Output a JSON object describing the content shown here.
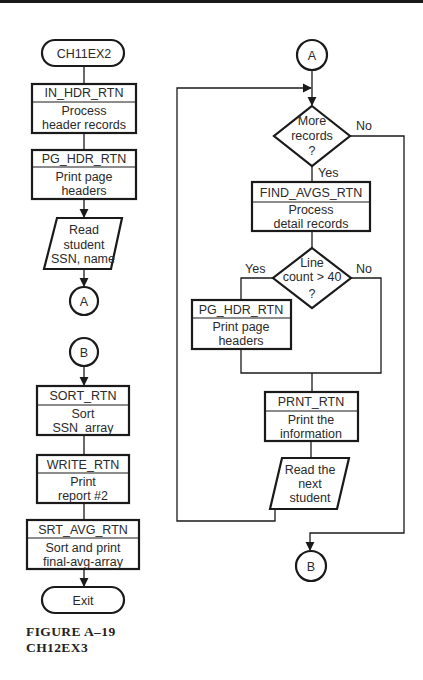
{
  "figure": {
    "caption_line1": "FIGURE A–19",
    "caption_line2": "CH12EX3"
  },
  "left_column": {
    "start_terminal": "CH11EX2",
    "in_hdr": {
      "name": "IN_HDR_RTN",
      "line1": "Process",
      "line2": "header records"
    },
    "pg_hdr": {
      "name": "PG_HDR_RTN",
      "line1": "Print page",
      "line2": "headers"
    },
    "read_student": {
      "line1": "Read",
      "line2": "student",
      "line3": "SSN, name"
    },
    "connector_a": "A",
    "connector_b": "B",
    "sort": {
      "name": "SORT_RTN",
      "line1": "Sort",
      "line2": "SSN_array"
    },
    "write": {
      "name": "WRITE_RTN",
      "line1": "Print",
      "line2": "report #2"
    },
    "srt_avg": {
      "name": "SRT_AVG_RTN",
      "line1": "Sort and print",
      "line2": "final-avg-array"
    },
    "exit_terminal": "Exit"
  },
  "right_column": {
    "connector_a": "A",
    "decision_more": {
      "line1": "More",
      "line2": "records",
      "line3": "?",
      "yes": "Yes",
      "no": "No"
    },
    "find_avgs": {
      "name": "FIND_AVGS_RTN",
      "line1": "Process",
      "line2": "detail records"
    },
    "decision_line": {
      "line1": "Line",
      "line2": "count > 40",
      "line3": "?",
      "yes": "Yes",
      "no": "No"
    },
    "pg_hdr": {
      "name": "PG_HDR_RTN",
      "line1": "Print page",
      "line2": "headers"
    },
    "prnt": {
      "name": "PRNT_RTN",
      "line1": "Print the",
      "line2": "information"
    },
    "read_next": {
      "line1": "Read the",
      "line2": "next",
      "line3": "student"
    },
    "connector_b": "B"
  }
}
